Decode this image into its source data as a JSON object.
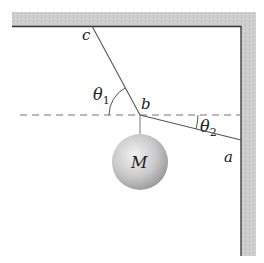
{
  "labels": {
    "c": "c",
    "b": "b",
    "a": "a",
    "theta1": "θ",
    "theta1_sub": "1",
    "theta2": "θ",
    "theta2_sub": "2",
    "mass": "M"
  },
  "colors": {
    "wall_fill": "#c8c8c8",
    "wall_edge": "#333333",
    "rope": "#555555",
    "ball_light": "#eeeeee",
    "ball_dark": "#9a9a9a"
  }
}
